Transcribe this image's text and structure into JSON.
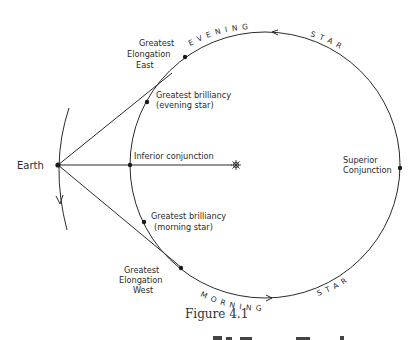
{
  "figure": {
    "caption": "Figure 4.1"
  },
  "labels": {
    "earth": "Earth",
    "sun": "sun-icon",
    "inferior_conjunction": "Inferior conjunction",
    "superior_conjunction_line1": "Superior",
    "superior_conjunction_line2": "Conjunction",
    "greatest_elongation_east_line1": "Greatest",
    "greatest_elongation_east_line2": "Elongation",
    "greatest_elongation_east_line3": "East",
    "greatest_elongation_west_line1": "Greatest",
    "greatest_elongation_west_line2": "Elongation",
    "greatest_elongation_west_line3": "West",
    "greatest_brilliancy_evening_line1": "Greatest brilliancy",
    "greatest_brilliancy_evening_line2": "(evening star)",
    "greatest_brilliancy_morning_line1": "Greatest brilliancy",
    "greatest_brilliancy_morning_line2": "(morning star)",
    "evening_arc": "EVENING",
    "star_arc_top": "STAR",
    "morning_arc": "MORNING",
    "star_arc_bottom": "STAR"
  },
  "colors": {
    "ink": "#2b2b2b",
    "background": "#ffffff"
  }
}
